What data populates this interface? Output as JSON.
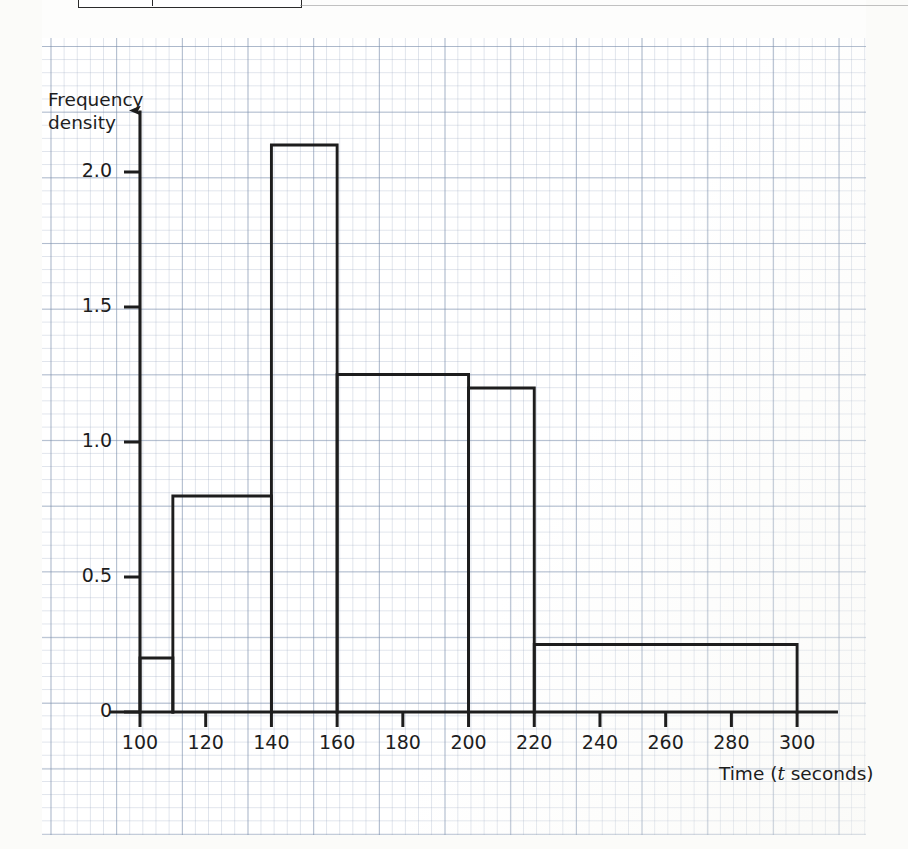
{
  "page": {
    "kind": "exam-question-histogram",
    "background_color": "#fdfdfc",
    "grid_color": "#8192ab",
    "ink_color": "#1d1d1d"
  },
  "chart_data": {
    "type": "bar",
    "title": "",
    "subtitle": "",
    "xlabel": "Time (t seconds)",
    "ylabel": "Frequency density",
    "ylabel_lines": [
      "Frequency",
      "density"
    ],
    "xlim": [
      100,
      310
    ],
    "ylim": [
      0,
      2.25
    ],
    "grid": true,
    "grid_style": "graph paper, 2mm minor / 10mm major",
    "legend": "none",
    "xticks": [
      100,
      120,
      140,
      160,
      180,
      200,
      220,
      240,
      260,
      280,
      300
    ],
    "xtick_labels": [
      "100",
      "120",
      "140",
      "160",
      "180",
      "200",
      "220",
      "240",
      "260",
      "280",
      "300"
    ],
    "yticks": [
      0,
      0.5,
      1.0,
      1.5,
      2.0
    ],
    "ytick_labels": [
      "0",
      "0.5",
      "1.0",
      "1.5",
      "2.0"
    ],
    "bin_edges": [
      100,
      110,
      140,
      160,
      200,
      220,
      300
    ],
    "bars": [
      {
        "label": "100 – 110",
        "x0": 100,
        "x1": 110,
        "density": 0.2
      },
      {
        "label": "110 – 140",
        "x0": 110,
        "x1": 140,
        "density": 0.8
      },
      {
        "label": "140 – 160",
        "x0": 140,
        "x1": 160,
        "density": 2.1
      },
      {
        "label": "160 – 200",
        "x0": 160,
        "x1": 200,
        "density": 1.25
      },
      {
        "label": "200 – 220",
        "x0": 200,
        "x1": 220,
        "density": 1.2
      },
      {
        "label": "220 – 300",
        "x0": 220,
        "x1": 300,
        "density": 0.25
      }
    ],
    "axis_arrow_y": true,
    "axis_arrow_x": false
  },
  "axes": {
    "y_title_line1": "Frequency",
    "y_title_line2": "density",
    "x_title_prefix": "Time (",
    "x_title_italic": "t",
    "x_title_suffix": " seconds)"
  }
}
